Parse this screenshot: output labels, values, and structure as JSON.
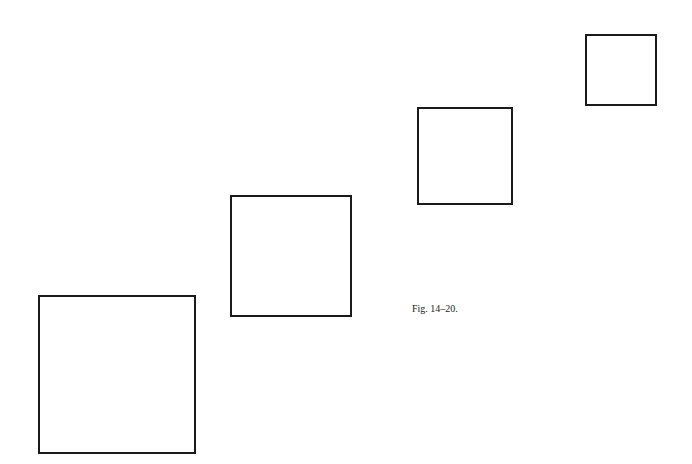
{
  "figure": {
    "caption": "Fig. 14–20.",
    "stroke_color": "#1a1a1a",
    "background_color": "#ffffff",
    "squares": [
      {
        "label": "largest",
        "x": 38,
        "y": 295,
        "width": 158,
        "height": 159
      },
      {
        "label": "large",
        "x": 230,
        "y": 195,
        "width": 122,
        "height": 122
      },
      {
        "label": "medium",
        "x": 417,
        "y": 107,
        "width": 96,
        "height": 98
      },
      {
        "label": "small",
        "x": 585,
        "y": 34,
        "width": 72,
        "height": 72
      }
    ]
  }
}
